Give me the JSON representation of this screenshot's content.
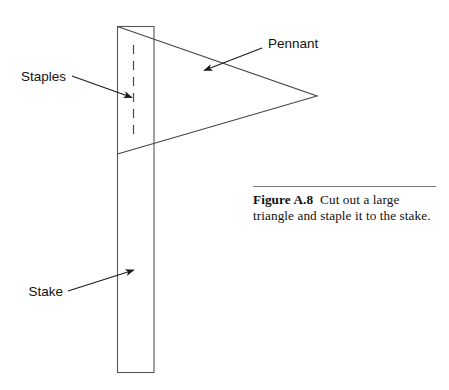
{
  "figure": {
    "background_color": "#ffffff",
    "line_color": "#333333",
    "text_color": "#111111",
    "rule_color": "#7a7a7a",
    "annotations": {
      "pennant_label": "Pennant",
      "staples_label": "Staples",
      "stake_label": "Stake"
    },
    "caption": {
      "number": "Figure A.8",
      "text": "Cut out a large triangle and staple it to the stake."
    },
    "geometry": {
      "stake": {
        "x": 117,
        "y": 26,
        "width": 37,
        "height": 347
      },
      "staples_dashed_line": {
        "x": 133,
        "y1": 45,
        "y2": 139
      },
      "pennant_triangle": {
        "apex_x": 317,
        "apex_y": 96,
        "top_x": 117,
        "top_y": 26,
        "bottom_x": 117,
        "bottom_y": 154
      },
      "pennant_leader": {
        "x1": 262,
        "y1": 48,
        "x2": 203,
        "y2": 71
      },
      "staples_leader": {
        "x1": 72,
        "y1": 76,
        "x2": 133,
        "y2": 98
      },
      "stake_leader": {
        "x1": 68,
        "y1": 291,
        "x2": 134,
        "y2": 270
      },
      "caption_rule": {
        "x": 253,
        "y": 192,
        "width": 183
      }
    }
  }
}
